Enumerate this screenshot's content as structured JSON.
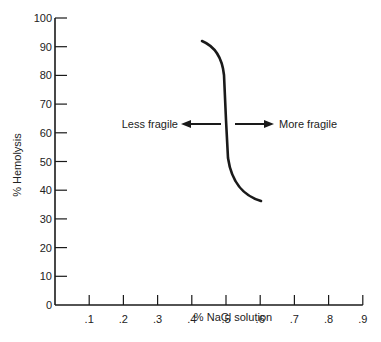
{
  "chart_data": {
    "type": "line",
    "title": "",
    "xlabel": "% NaCl solution",
    "ylabel": "% Hemolysis",
    "xlim": [
      0,
      0.9
    ],
    "ylim": [
      0,
      100
    ],
    "grid": false,
    "legend": null,
    "x_ticks": [
      ".1",
      ".2",
      ".3",
      ".4",
      ".5",
      ".6",
      ".7",
      ".8",
      ".9"
    ],
    "y_ticks": [
      "0",
      "10",
      "20",
      "30",
      "40",
      "50",
      "60",
      "70",
      "80",
      "90",
      "100"
    ],
    "series": [
      {
        "name": "Osmotic fragility curve",
        "x": [
          0.42,
          0.45,
          0.47,
          0.48,
          0.485,
          0.49,
          0.5,
          0.52,
          0.55,
          0.59
        ],
        "y": [
          92,
          89,
          85,
          80,
          65,
          55,
          45,
          40,
          37,
          35
        ]
      }
    ],
    "annotations": [
      {
        "text": "Less fragile",
        "arrow": "left",
        "y": 63
      },
      {
        "text": "More fragile",
        "arrow": "right",
        "y": 63
      }
    ]
  },
  "labels": {
    "xlabel": "% NaCl solution",
    "ylabel": "% Hemolysis",
    "less_fragile": "Less fragile",
    "more_fragile": "More fragile"
  },
  "colors": {
    "ink": "#1a1a1a",
    "background": "#ffffff"
  }
}
